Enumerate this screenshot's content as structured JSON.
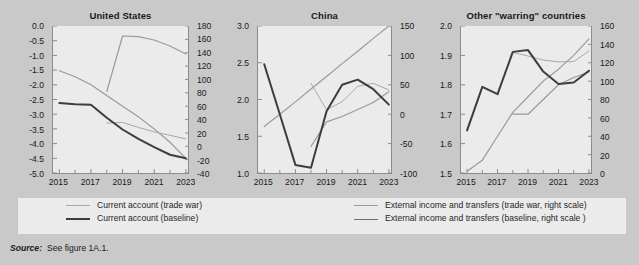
{
  "figure": {
    "source_label": "Source:",
    "source_text": "See figure 1A.1."
  },
  "legend": {
    "items": [
      {
        "label": "Current account  (trade war)",
        "color": "#a8a8a8",
        "width": 1.0
      },
      {
        "label": "External income and transfers (trade war, right scale)",
        "color": "#9a9a9a",
        "width": 1.2
      },
      {
        "label": "Current account (baseline)",
        "color": "#3d3d3d",
        "width": 2.0
      },
      {
        "label": "External income and transfers (baseline, right scale )",
        "color": "#6e6e6e",
        "width": 1.8
      }
    ]
  },
  "chart_data": [
    {
      "type": "line",
      "title": "United States",
      "xlabel": "",
      "ylabel": "",
      "x": [
        2015,
        2016,
        2017,
        2018,
        2019,
        2020,
        2021,
        2022,
        2023
      ],
      "xticks": [
        2015,
        2017,
        2019,
        2021,
        2023
      ],
      "xlim": [
        2014.6,
        2023.2
      ],
      "ylim": [
        -5.0,
        0.0
      ],
      "yticks": [
        0.0,
        -0.5,
        -1.0,
        -1.5,
        -2.0,
        -2.5,
        -3.0,
        -3.5,
        -4.0,
        -4.5,
        -5.0
      ],
      "ytick_labels": [
        "0.0",
        "-0.5",
        "-1.0",
        "-1.5",
        "-2.0",
        "-2.5",
        "-3.0",
        "-3.5",
        "-4.0",
        "-4.5",
        "-5.0"
      ],
      "ylim_right": [
        -40,
        180
      ],
      "yticks_right": [
        180,
        160,
        140,
        120,
        100,
        80,
        60,
        40,
        20,
        0,
        -20,
        -40
      ],
      "grid": false,
      "series": [
        {
          "name": "Current account (baseline)",
          "axis": "left",
          "x": [
            2015,
            2016,
            2017,
            2018,
            2019,
            2020,
            2021,
            2022,
            2023
          ],
          "values": [
            -2.62,
            -2.66,
            -2.68,
            -3.12,
            -3.52,
            -3.84,
            -4.12,
            -4.38,
            -4.5
          ]
        },
        {
          "name": "Current account (trade war)",
          "axis": "left",
          "x": [
            2018,
            2019,
            2020,
            2021,
            2022,
            2023
          ],
          "values": [
            -3.3,
            -3.28,
            -3.45,
            -3.6,
            -3.72,
            -3.84
          ]
        },
        {
          "name": "External income and transfers (baseline, right scale)",
          "axis": "right",
          "x": [
            2015,
            2016,
            2017,
            2018,
            2019,
            2020,
            2021,
            2022,
            2023
          ],
          "values": [
            113,
            104,
            92,
            76,
            60,
            44,
            26,
            6,
            -18
          ]
        },
        {
          "name": "External income and transfers (trade war, right scale)",
          "axis": "right",
          "x": [
            2018,
            2019,
            2020,
            2021,
            2022,
            2023
          ],
          "values": [
            82,
            165,
            164,
            159,
            150,
            138
          ]
        }
      ]
    },
    {
      "type": "line",
      "title": "China",
      "xlabel": "",
      "ylabel": "",
      "x": [
        2015,
        2016,
        2017,
        2018,
        2019,
        2020,
        2021,
        2022,
        2023
      ],
      "xticks": [
        2015,
        2017,
        2019,
        2021,
        2023
      ],
      "xlim": [
        2014.6,
        2023.2
      ],
      "ylim": [
        1.0,
        3.0
      ],
      "yticks": [
        3.0,
        2.5,
        2.0,
        1.5,
        1.0
      ],
      "ytick_labels": [
        "3.0",
        "2.5",
        "2.0",
        "1.5",
        "1.0"
      ],
      "ylim_right": [
        -100,
        150
      ],
      "yticks_right": [
        150,
        100,
        50,
        0,
        -50,
        -100
      ],
      "grid": false,
      "series": [
        {
          "name": "Current account (baseline)",
          "axis": "left",
          "x": [
            2015,
            2016,
            2017,
            2018,
            2019,
            2020,
            2021,
            2022,
            2023
          ],
          "values": [
            2.48,
            1.8,
            1.11,
            1.07,
            1.84,
            2.2,
            2.27,
            2.14,
            1.93
          ]
        },
        {
          "name": "Current account (trade war)",
          "axis": "left",
          "x": [
            2018,
            2019,
            2020,
            2021,
            2022,
            2023
          ],
          "values": [
            2.22,
            1.86,
            1.97,
            2.18,
            2.22,
            2.13
          ]
        },
        {
          "name": "External income and transfers (baseline, right scale)",
          "axis": "right",
          "x": [
            2015,
            2016,
            2017,
            2018,
            2019,
            2020,
            2021,
            2022,
            2023
          ],
          "values": [
            -21,
            0,
            21,
            43,
            64,
            86,
            107,
            129,
            150
          ]
        },
        {
          "name": "External income and transfers (trade war, right scale)",
          "axis": "right",
          "x": [
            2018,
            2019,
            2020,
            2021,
            2022,
            2023
          ],
          "values": [
            -55,
            -13,
            -4,
            8,
            20,
            38
          ]
        }
      ]
    },
    {
      "type": "line",
      "title": "Other \"warring\" countries",
      "xlabel": "",
      "ylabel": "",
      "x": [
        2015,
        2016,
        2017,
        2018,
        2019,
        2020,
        2021,
        2022,
        2023
      ],
      "xticks": [
        2015,
        2017,
        2019,
        2021,
        2023
      ],
      "xlim": [
        2014.6,
        2023.2
      ],
      "ylim": [
        1.5,
        2.0
      ],
      "yticks": [
        2.0,
        1.9,
        1.8,
        1.7,
        1.6,
        1.5
      ],
      "ytick_labels": [
        "2.0",
        "1.9",
        "1.8",
        "1.7",
        "1.6",
        "1.5"
      ],
      "ylim_right": [
        0,
        160
      ],
      "yticks_right": [
        160,
        140,
        120,
        100,
        80,
        60,
        40,
        20,
        0
      ],
      "grid": false,
      "series": [
        {
          "name": "Current account (baseline)",
          "axis": "left",
          "x": [
            2015,
            2016,
            2017,
            2018,
            2019,
            2020,
            2021,
            2022,
            2023
          ],
          "values": [
            1.645,
            1.793,
            1.768,
            1.912,
            1.918,
            1.845,
            1.803,
            1.808,
            1.848
          ]
        },
        {
          "name": "Current account (trade war)",
          "axis": "left",
          "x": [
            2018,
            2019,
            2020,
            2021,
            2022,
            2023
          ],
          "values": [
            1.91,
            1.898,
            1.884,
            1.878,
            1.879,
            1.915
          ]
        },
        {
          "name": "External income and transfers (baseline, right scale)",
          "axis": "right",
          "x": [
            2015,
            2016,
            2017,
            2018,
            2019,
            2020,
            2021,
            2022,
            2023
          ],
          "values": [
            2,
            14,
            40,
            66,
            83,
            100,
            113,
            128,
            146
          ]
        },
        {
          "name": "External income and transfers (trade war, right scale)",
          "axis": "right",
          "x": [
            2018,
            2019,
            2020,
            2021,
            2022,
            2023
          ],
          "values": [
            64,
            64,
            80,
            96,
            104,
            110
          ]
        }
      ]
    }
  ]
}
